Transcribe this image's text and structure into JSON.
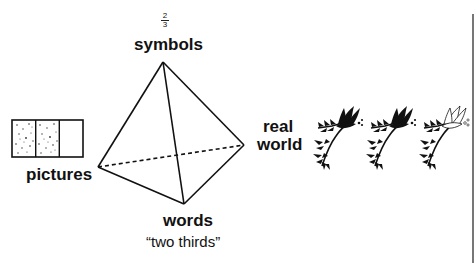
{
  "diagram": {
    "type": "tetrahedron-of-representations",
    "fraction": {
      "numerator": "2",
      "denominator": "3"
    },
    "vertices": {
      "top": {
        "label": "symbols"
      },
      "left": {
        "label": "pictures"
      },
      "right": {
        "label": "real",
        "label2": "world"
      },
      "bottom": {
        "label": "words",
        "sublabel": "“two thirds”"
      }
    },
    "picture_model": {
      "cells": 3,
      "shaded_cells": 2
    },
    "real_world_model": {
      "items": 3,
      "highlighted_items": 2
    },
    "colors": {
      "ink": "#111111",
      "background": "#ffffff",
      "edge": "#777777"
    }
  }
}
